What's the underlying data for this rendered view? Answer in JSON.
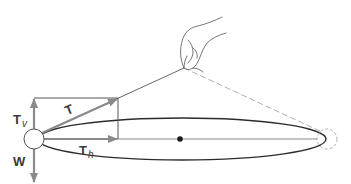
{
  "diagram": {
    "type": "physics-force-diagram",
    "labels": {
      "tension": {
        "main": "T",
        "sub": ""
      },
      "tension_vertical": {
        "main": "T",
        "sub": "v"
      },
      "tension_horizontal": {
        "main": "T",
        "sub": "h"
      },
      "weight": {
        "main": "W",
        "sub": ""
      }
    },
    "elements": [
      "ball",
      "string",
      "hand",
      "circular-path-ellipse",
      "center-point",
      "dashed-ball-opposite",
      "dashed-string",
      "force-rectangle",
      "arrow-T",
      "arrow-Tv",
      "arrow-Th",
      "arrow-W"
    ],
    "colors": {
      "arrow": "#8a8a8a",
      "line": "#3a3a3a",
      "dashed": "#b0b0b0",
      "label": "#3a3a3a"
    }
  }
}
